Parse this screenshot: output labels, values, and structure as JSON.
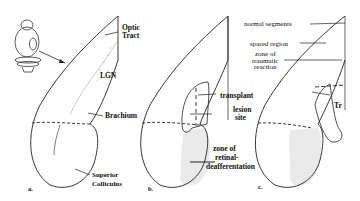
{
  "figure": {
    "panels": [
      {
        "id": "a",
        "label": "a."
      },
      {
        "id": "b",
        "label": "b."
      },
      {
        "id": "c",
        "label": "c."
      }
    ],
    "panel_a_labels": {
      "optic": "Optic",
      "tract": "Tract",
      "lgn": "LGN",
      "brachium": "Brachium",
      "superior": "Superior",
      "colliculus": "Colliculus"
    },
    "panel_b_labels": {
      "transplant": "transplant",
      "lesion": "lesion",
      "site": "site",
      "zone_of": "zone of",
      "retinal": "retinal-",
      "deafferentation": "deafferentation"
    },
    "panel_c_labels": {
      "normal_segments": "normal  segments",
      "spared_region": "spared  region",
      "zone_of": "zone of",
      "traumatic": "traumatic",
      "reaction": "reaction",
      "tr": "Tr"
    },
    "colors": {
      "ink": "#111111",
      "shade": "#e8e8e8",
      "background": "#ffffff"
    }
  }
}
